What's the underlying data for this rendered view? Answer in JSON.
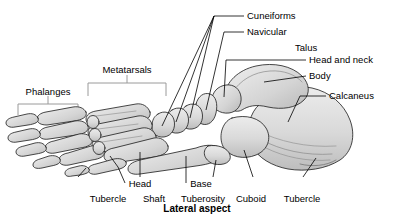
{
  "figure": {
    "caption": "Lateral aspect",
    "view": "lateral",
    "colors": {
      "bone_fill": "#d9d9d9",
      "bone_fill_light": "#e6e6e6",
      "bone_outline": "#1a1a1a",
      "shading": "#b3b3b3",
      "leader_line": "#000000",
      "bracket_line": "#9a9a9a",
      "background": "#ffffff",
      "text": "#000000"
    },
    "labels": {
      "phalanges": "Phalanges",
      "metatarsals": "Metatarsals",
      "cuneiforms": "Cuneiforms",
      "navicular": "Navicular",
      "talus": "Talus",
      "head_and_neck": "Head and neck",
      "body": "Body",
      "calcaneus": "Calcaneus",
      "head": "Head",
      "base": "Base",
      "tubercle_left": "Tubercle",
      "shaft": "Shaft",
      "tuberosity": "Tuberosity",
      "cuboid": "Cuboid",
      "tubercle_right": "Tubercle"
    }
  }
}
